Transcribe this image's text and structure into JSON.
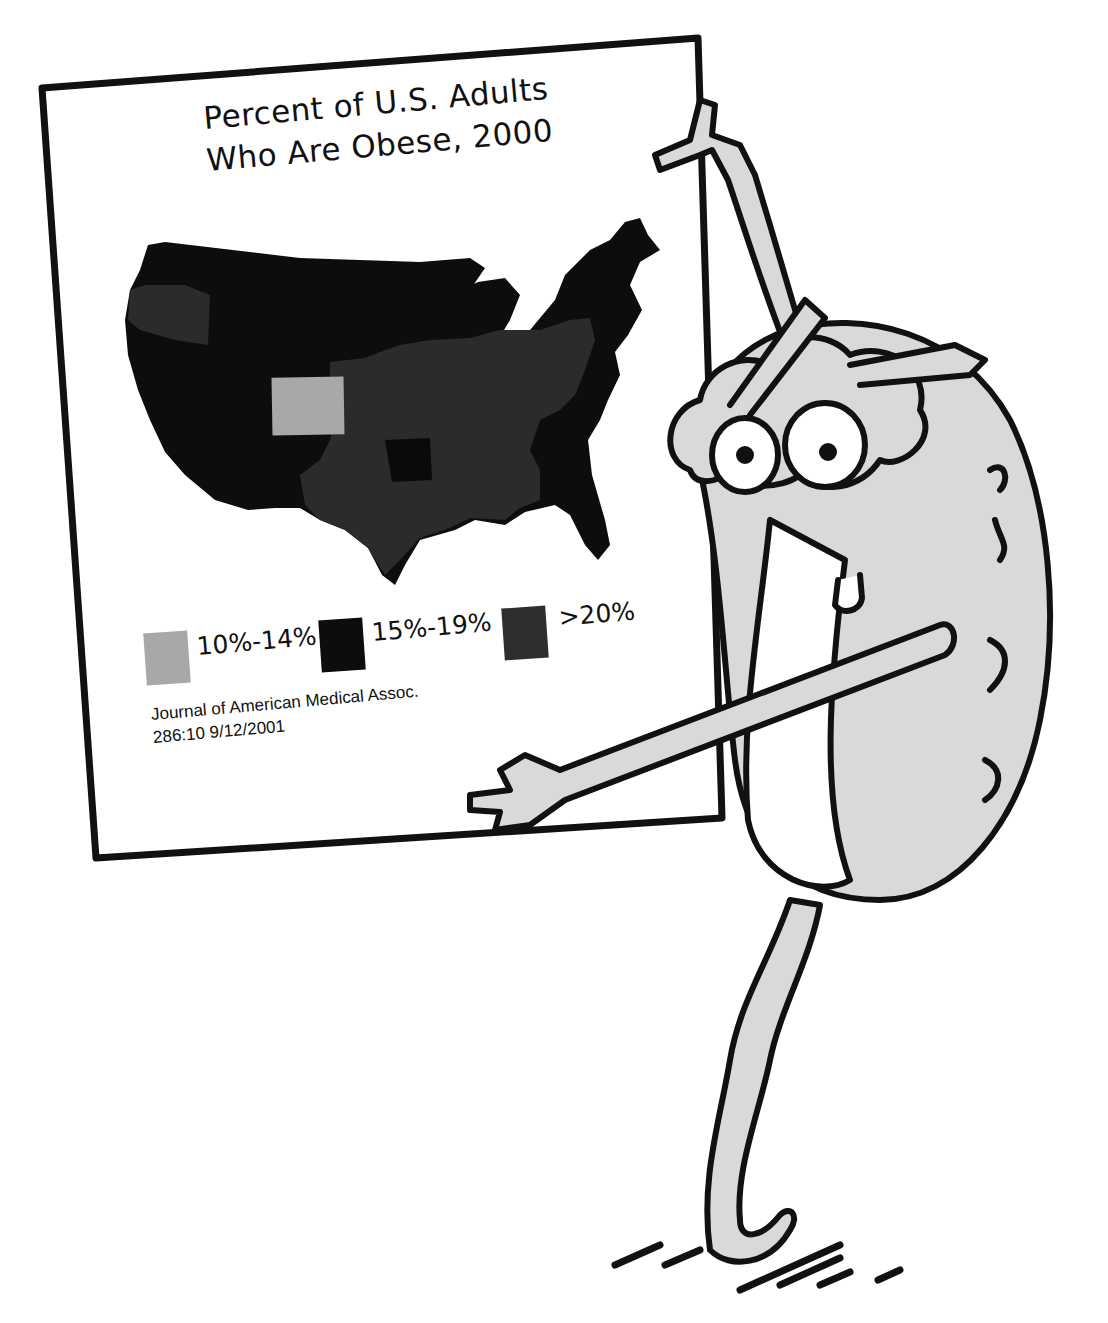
{
  "poster": {
    "title_line1": "Percent of U.S. Adults",
    "title_line2": "Who Are Obese, 2000",
    "legend": [
      {
        "label": "10%-14%",
        "color": "#a8a8a8"
      },
      {
        "label": "15%-19%",
        "color": "#0d0d0d"
      },
      {
        "label": ">20%",
        "color": "#2e2e2e"
      }
    ],
    "citation_line1": "Journal of American Medical Assoc.",
    "citation_line2": "286:10 9/12/2001"
  },
  "map": {
    "type": "choropleth",
    "region": "Contiguous United States",
    "highlighted_light_state": "Colorado"
  },
  "character": {
    "description": "Cartoon brain-like character with glasses pointing at the poster"
  }
}
